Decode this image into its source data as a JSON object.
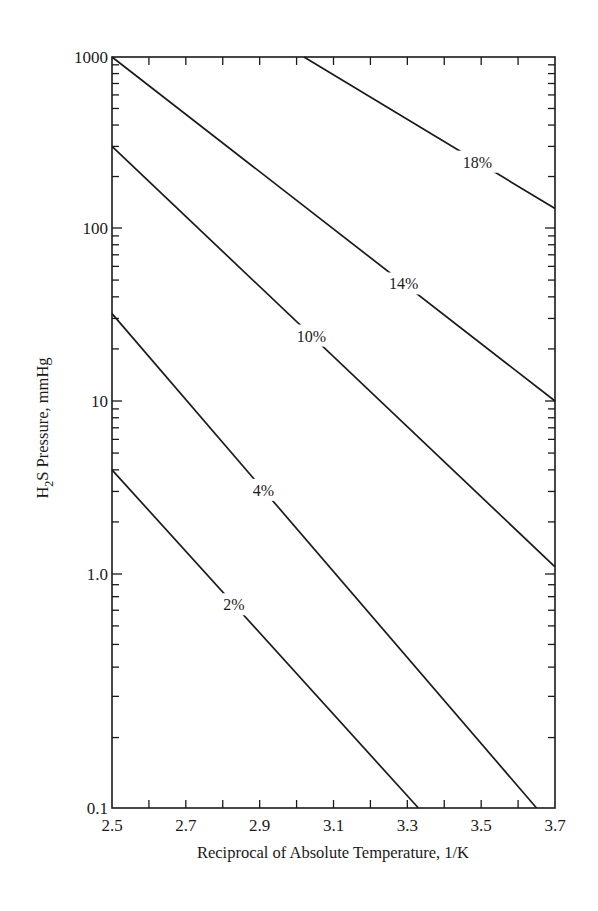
{
  "chart_data": {
    "type": "line",
    "title": "",
    "xlabel": "Reciprocal of Absolute Temperature, 1/K",
    "ylabel": "H2S Pressure, mmHg",
    "ylabel_parts": {
      "prefix": "H",
      "subscript": "2",
      "suffix": "S Pressure, mmHg"
    },
    "xlim": [
      2.5,
      3.7
    ],
    "ylim": [
      0.1,
      1000
    ],
    "yscale": "log",
    "grid": false,
    "legend": "inline labels on lines",
    "x_ticks": [
      {
        "value": 2.5,
        "label": "2.5"
      },
      {
        "value": 2.7,
        "label": "2.7"
      },
      {
        "value": 2.9,
        "label": "2.9"
      },
      {
        "value": 3.1,
        "label": "3.1"
      },
      {
        "value": 3.3,
        "label": "3.3"
      },
      {
        "value": 3.5,
        "label": "3.5"
      },
      {
        "value": 3.7,
        "label": "3.7"
      }
    ],
    "x_minor_ticks": [
      2.6,
      2.8,
      3.0,
      3.2,
      3.4,
      3.6
    ],
    "y_ticks": [
      {
        "value": 1000,
        "label": "1000"
      },
      {
        "value": 100,
        "label": "100"
      },
      {
        "value": 10,
        "label": "10"
      },
      {
        "value": 1,
        "label": "1.0"
      },
      {
        "value": 0.1,
        "label": "0.1"
      }
    ],
    "series": [
      {
        "name": "18%",
        "x": [
          3.02,
          3.7
        ],
        "y": [
          1000,
          130
        ],
        "label_at": [
          3.49,
          0
        ]
      },
      {
        "name": "14%",
        "x": [
          2.5,
          3.7
        ],
        "y": [
          1000,
          10
        ],
        "label_at": [
          3.29,
          0
        ]
      },
      {
        "name": "10%",
        "x": [
          2.5,
          3.7
        ],
        "y": [
          300,
          1.1
        ],
        "label_at": [
          3.04,
          0
        ]
      },
      {
        "name": "4%",
        "x": [
          2.5,
          3.65
        ],
        "y": [
          32,
          0.1
        ],
        "label_at": [
          2.91,
          0
        ]
      },
      {
        "name": "2%",
        "x": [
          2.5,
          3.33
        ],
        "y": [
          4.0,
          0.1
        ],
        "label_at": [
          2.83,
          0
        ]
      }
    ]
  }
}
